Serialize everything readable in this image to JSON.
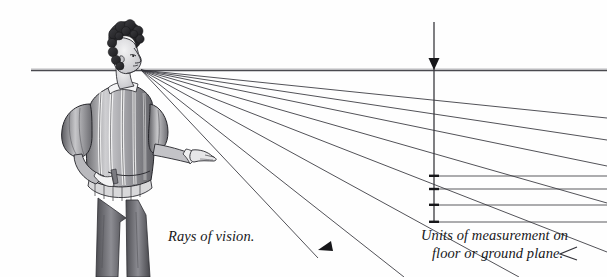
{
  "figure": {
    "name": "rays-of-vision-perspective-diagram",
    "background_color": "#fefefe",
    "ink_color": "#1b1b1e",
    "line_color": "#3a3a3e",
    "width": 607,
    "height": 277
  },
  "captions": {
    "rays_label": "Rays of vision.",
    "units_label_line1": "Units of measurement on",
    "units_label_line2": "floor or ground plane."
  },
  "geometry": {
    "horizon_line": {
      "x1": 31,
      "y1": 70.5,
      "x2": 607,
      "y2": 70.5
    },
    "vanishing_point": {
      "x": 141,
      "y": 70
    },
    "measuring_line": {
      "x": 434,
      "y_top": 22,
      "y_bottom": 223
    },
    "arrow_down": {
      "x": 434,
      "y_tip": 70
    },
    "ray_endpoints": [
      {
        "x": 607,
        "y": 118
      },
      {
        "x": 607,
        "y": 140
      },
      {
        "x": 607,
        "y": 166
      },
      {
        "x": 607,
        "y": 203
      },
      {
        "x": 607,
        "y": 252
      },
      {
        "x": 519,
        "y": 277
      },
      {
        "x": 404,
        "y": 277
      },
      {
        "x": 318,
        "y": 255
      }
    ],
    "ground_tick_lines": [
      {
        "y": 176,
        "x_from": 434,
        "x_to": 607
      },
      {
        "y": 189,
        "x_from": 434,
        "x_to": 607
      },
      {
        "y": 205,
        "x_from": 434,
        "x_to": 607
      },
      {
        "y": 222,
        "x_from": 434,
        "x_to": 607
      }
    ],
    "arrowheads": [
      {
        "name": "ray-arrowhead-lower-left",
        "x": 327,
        "y": 246,
        "angle": 205
      },
      {
        "name": "ray-arrowhead-lower-right",
        "x": 566,
        "y": 254,
        "angle": 195
      }
    ]
  },
  "figure_person": {
    "description": "Renaissance man in slashed doublet seen from behind, pointing toward the horizon"
  }
}
